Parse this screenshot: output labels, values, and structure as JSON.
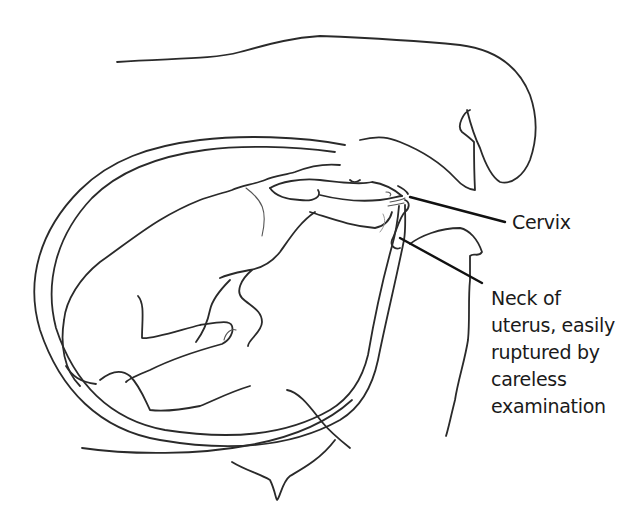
{
  "figure": {
    "style": "black ink line drawing on white",
    "colors": {
      "background": "#ffffff",
      "line": "#2a2a2a",
      "text": "#1a1a1a"
    }
  },
  "labels": {
    "cervix": {
      "text": "Cervix"
    },
    "neck_of_uterus": {
      "lines": [
        "Neck of",
        "uterus, easily",
        "ruptured by",
        "careless",
        "examination"
      ]
    }
  },
  "parts": [
    "uterus-wall-outer",
    "uterus-wall-inner",
    "calf-body",
    "calf-head",
    "calf-forelegs",
    "calf-hindlegs",
    "cervix",
    "vagina-neck",
    "rectum",
    "pelvis-outline"
  ]
}
